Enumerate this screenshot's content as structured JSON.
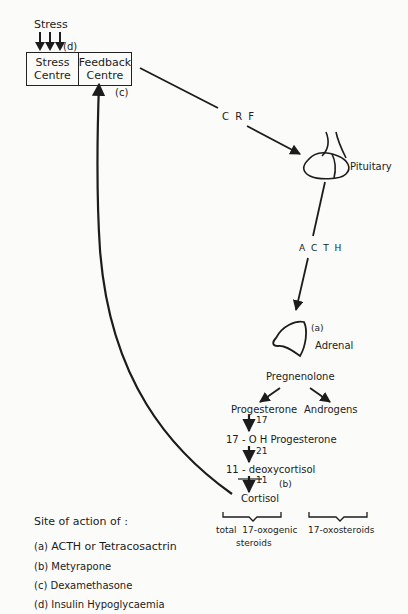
{
  "diagram": {
    "type": "hypothalamic-pituitary-adrenal axis flow diagram",
    "stress_label": "Stress",
    "stress_marker": "(d)",
    "box": {
      "left_cell": [
        "Stress",
        "Centre"
      ],
      "right_cell": [
        "Feedback",
        "Centre"
      ],
      "feedback_marker": "(c)"
    },
    "hormones": {
      "crf": "C R F",
      "acth": "A C T H"
    },
    "organs": {
      "pituitary": "Pituitary",
      "adrenal": "Adrenal",
      "adrenal_marker": "(a)"
    },
    "pathway": {
      "pregnenolone": "Pregnenolone",
      "progesterone": "Progesterone",
      "androgens": "Androgens",
      "step_17": "17",
      "oh_progesterone": "17 - O H Progesterone",
      "step_21": "21",
      "deoxycortisol": "11 - deoxycortisol",
      "step_11": "11",
      "cortisol_marker": "(b)",
      "cortisol": "Cortisol"
    },
    "groups": {
      "left": [
        "total  17-oxogenic",
        "steroids"
      ],
      "right": "17-oxosteroids"
    },
    "legend": {
      "title": "Site of action of :",
      "items": [
        {
          "marker": "(a)",
          "label": "ACTH or Tetracosactrin"
        },
        {
          "marker": "(b)",
          "label": "Metyrapone"
        },
        {
          "marker": "(c)",
          "label": "Dexamethasone"
        },
        {
          "marker": "(d)",
          "label": "Insulin Hypoglycaemia"
        }
      ]
    },
    "colors": {
      "ink": "#1c1c1c",
      "paper": "#fbfbf9"
    }
  }
}
